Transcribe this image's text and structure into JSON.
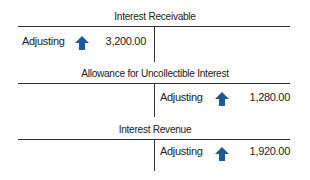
{
  "accounts": [
    {
      "title": "Interest Receivable",
      "side": "debit",
      "entry": {
        "label": "Adjusting",
        "direction": "increase",
        "icon": "up-arrow-icon",
        "amount": "3,200.00"
      }
    },
    {
      "title": "Allowance for Uncollectible Interest",
      "side": "credit",
      "entry": {
        "label": "Adjusting",
        "direction": "increase",
        "icon": "up-arrow-icon",
        "amount": "1,280.00"
      }
    },
    {
      "title": "Interest Revenue",
      "side": "credit",
      "entry": {
        "label": "Adjusting",
        "direction": "increase",
        "icon": "up-arrow-icon",
        "amount": "1,920.00"
      }
    }
  ],
  "colors": {
    "arrow": "#1a5a9a",
    "line": "#333333"
  }
}
